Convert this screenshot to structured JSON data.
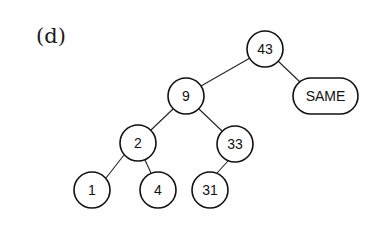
{
  "panel": {
    "label": "(d)"
  },
  "tree": {
    "nodes": [
      {
        "id": "n43",
        "label": "43",
        "shape": "circle",
        "cx": 265,
        "cy": 49,
        "r": 18
      },
      {
        "id": "n9",
        "label": "9",
        "shape": "circle",
        "cx": 186,
        "cy": 96,
        "r": 18
      },
      {
        "id": "nSAME",
        "label": "SAME",
        "shape": "pill",
        "x": 293,
        "y": 78,
        "w": 65,
        "h": 36
      },
      {
        "id": "n2",
        "label": "2",
        "shape": "circle",
        "cx": 138,
        "cy": 143,
        "r": 18
      },
      {
        "id": "n33",
        "label": "33",
        "shape": "circle",
        "cx": 235,
        "cy": 144,
        "r": 18
      },
      {
        "id": "n1",
        "label": "1",
        "shape": "circle",
        "cx": 92,
        "cy": 190,
        "r": 18
      },
      {
        "id": "n4",
        "label": "4",
        "shape": "circle",
        "cx": 158,
        "cy": 190,
        "r": 18
      },
      {
        "id": "n31",
        "label": "31",
        "shape": "circle",
        "cx": 210,
        "cy": 190,
        "r": 18
      }
    ],
    "edges": [
      {
        "from": "n43",
        "to": "n9"
      },
      {
        "from": "n43",
        "to": "nSAME"
      },
      {
        "from": "n9",
        "to": "n2"
      },
      {
        "from": "n9",
        "to": "n33"
      },
      {
        "from": "n2",
        "to": "n1"
      },
      {
        "from": "n2",
        "to": "n4"
      },
      {
        "from": "n33",
        "to": "n31"
      }
    ]
  }
}
